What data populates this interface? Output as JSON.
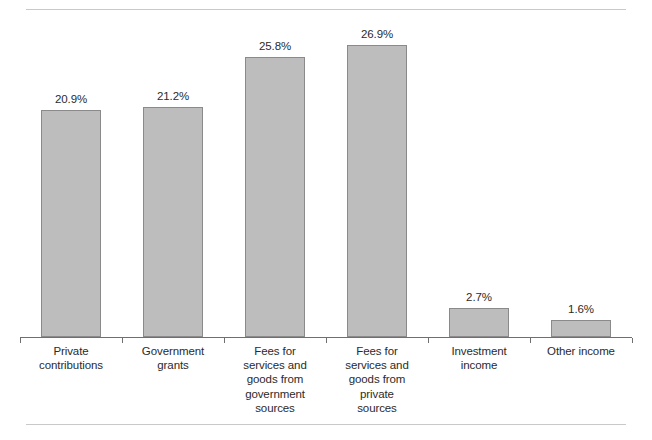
{
  "chart_data": {
    "type": "bar",
    "title": "",
    "subtitle": "",
    "xlabel": "",
    "ylabel": "",
    "ylim": [
      0,
      30
    ],
    "grid": false,
    "legend": "none",
    "orientation": "vertical",
    "value_label_format": "percent",
    "categories": [
      "Private\ncontributions",
      "Government\ngrants",
      "Fees for\nservices and\ngoods from\ngovernment\nsources",
      "Fees for\nservices and\ngoods from\nprivate\nsources",
      "Investment\nincome",
      "Other income"
    ],
    "values": [
      20.9,
      21.2,
      25.8,
      26.9,
      2.7,
      1.6
    ],
    "value_labels": [
      "20.9%",
      "21.2%",
      "25.8%",
      "26.9%",
      "2.7%",
      "1.6%"
    ],
    "colors": {
      "bar_fill": "#bdbdbd",
      "bar_border": "#8a8a8a",
      "axis": "#6f6f6f",
      "rule": "#c9c9c9",
      "text": "#2b2b2b",
      "background": "#ffffff"
    }
  }
}
